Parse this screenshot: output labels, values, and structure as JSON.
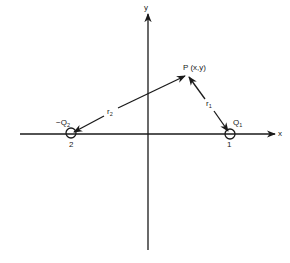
{
  "diagram": {
    "axes": {
      "x_label": "x",
      "y_label": "y"
    },
    "point": {
      "label": "P (x,y)",
      "coords": [
        187,
        75
      ]
    },
    "charges": [
      {
        "id": "1",
        "symbol": "Q",
        "subscript": "1",
        "sign": "",
        "index_label": "1",
        "coords": [
          230,
          133
        ]
      },
      {
        "id": "2",
        "symbol": "Q",
        "subscript": "2",
        "sign": "−",
        "index_label": "2",
        "coords": [
          71,
          133
        ]
      }
    ],
    "vectors": [
      {
        "name": "r",
        "subscript": "1",
        "from": "charge-1",
        "to": "P"
      },
      {
        "name": "r",
        "subscript": "2",
        "from": "charge-2",
        "to": "P"
      }
    ],
    "colors": {
      "ink": "#1a1a1a",
      "background": "#ffffff"
    }
  }
}
